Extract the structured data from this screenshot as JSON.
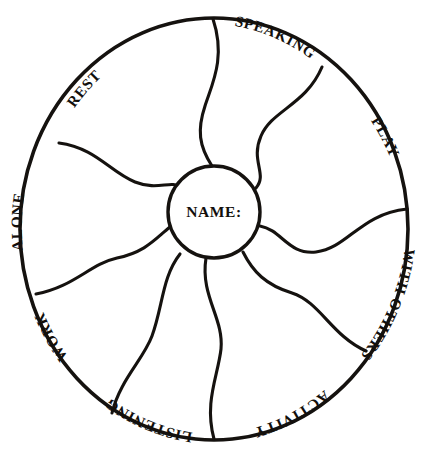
{
  "document": {
    "title": "Wheel Worksheet",
    "background_color": "#ffffff",
    "ink_color": "#15120f"
  },
  "wheel": {
    "center_label": "NAME:",
    "center_circle": {
      "cx": 214,
      "cy": 212,
      "r": 46
    },
    "outer_circle": {
      "cx": 214,
      "cy": 229,
      "rx": 194,
      "ry": 211
    },
    "segment_count": 8,
    "segments": [
      {
        "id": "speaking",
        "label": "SPEAKING",
        "position": "top-right",
        "label_upright": true
      },
      {
        "id": "play",
        "label": "PLAY",
        "position": "right-upper",
        "label_upright": true
      },
      {
        "id": "with-others",
        "label": "WITH OTHERS",
        "position": "right-lower",
        "label_upright": false
      },
      {
        "id": "activity",
        "label": "ACTIVITY",
        "position": "bottom-right",
        "label_upright": false
      },
      {
        "id": "listening",
        "label": "LISTENING",
        "position": "bottom-left",
        "label_upright": false
      },
      {
        "id": "work",
        "label": "WORK",
        "position": "left-lower",
        "label_upright": false
      },
      {
        "id": "alone",
        "label": "ALONE",
        "position": "left-upper",
        "label_upright": true
      },
      {
        "id": "rest",
        "label": "REST",
        "position": "top-left",
        "label_upright": true
      }
    ]
  }
}
